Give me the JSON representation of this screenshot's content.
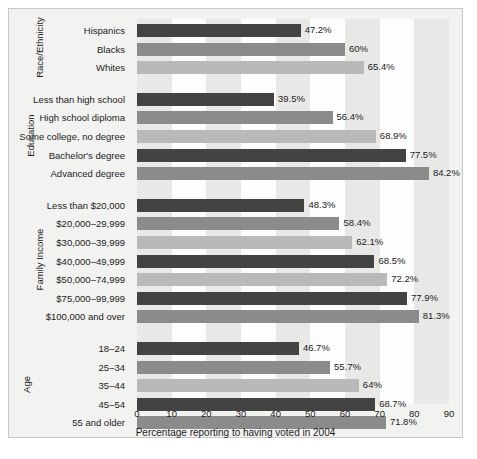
{
  "chart_data": {
    "type": "bar",
    "orientation": "horizontal",
    "title": "",
    "xlabel": "Percentage reporting to having voted in 2004",
    "ylabel": "",
    "xlim": [
      0,
      90
    ],
    "xticks": [
      0,
      10,
      20,
      30,
      40,
      50,
      60,
      70,
      80,
      90
    ],
    "grid": "alternating vertical bands every 10 units",
    "legend": "none",
    "groups": [
      {
        "name": "Race/Ethnicity",
        "categories": [
          "Hispanics",
          "Blacks",
          "Whites"
        ],
        "values": [
          47.2,
          60,
          65.4
        ],
        "labels": [
          "47.2%",
          "60%",
          "65.4%"
        ],
        "shades": [
          "dark",
          "mid",
          "light"
        ]
      },
      {
        "name": "Education",
        "categories": [
          "Less than high school",
          "High school diploma",
          "Some college, no degree",
          "Bachelor's degree",
          "Advanced degree"
        ],
        "values": [
          39.5,
          56.4,
          68.9,
          77.5,
          84.2
        ],
        "labels": [
          "39.5%",
          "56.4%",
          "68.9%",
          "77.5%",
          "84.2%"
        ],
        "shades": [
          "dark",
          "mid",
          "light",
          "dark",
          "mid"
        ]
      },
      {
        "name": "Family Income",
        "categories": [
          "Less than $20,000",
          "$20,000–29,999",
          "$30,000–39,999",
          "$40,000–49,999",
          "$50,000–74,999",
          "$75,000–99,999",
          "$100,000 and over"
        ],
        "values": [
          48.3,
          58.4,
          62.1,
          68.5,
          72.2,
          77.9,
          81.3
        ],
        "labels": [
          "48.3%",
          "58.4%",
          "62.1%",
          "68.5%",
          "72.2%",
          "77.9%",
          "81.3%"
        ],
        "shades": [
          "dark",
          "mid",
          "light",
          "dark",
          "light",
          "dark",
          "mid"
        ]
      },
      {
        "name": "Age",
        "categories": [
          "18–24",
          "25–34",
          "35–44",
          "45–54",
          "55 and older"
        ],
        "values": [
          46.7,
          55.7,
          64,
          68.7,
          71.8
        ],
        "labels": [
          "46.7%",
          "55.7%",
          "64%",
          "68.7%",
          "71.8%"
        ],
        "shades": [
          "dark",
          "mid",
          "light",
          "dark",
          "mid"
        ]
      }
    ],
    "colors": {
      "dark": "#434343",
      "mid": "#8b8b8b",
      "light": "#b9b9b9",
      "band_light": "#e8e8e7",
      "band_white": "#fdfdfd",
      "background": "#f2f2f1",
      "text": "#1c1c1c"
    }
  }
}
